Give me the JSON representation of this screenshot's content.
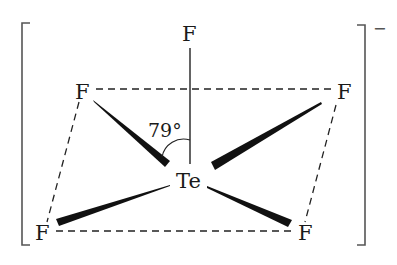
{
  "diagram": {
    "central_atom": {
      "label": "Te",
      "x": 189,
      "y": 188
    },
    "ligands": [
      {
        "id": "apical",
        "label": "F",
        "x": 190,
        "y": 41
      },
      {
        "id": "upper-left",
        "label": "F",
        "x": 82,
        "y": 99
      },
      {
        "id": "upper-right",
        "label": "F",
        "x": 344,
        "y": 99
      },
      {
        "id": "lower-left",
        "label": "F",
        "x": 42,
        "y": 239
      },
      {
        "id": "lower-right",
        "label": "F",
        "x": 305,
        "y": 239
      }
    ],
    "angle": {
      "label": "79°",
      "between": [
        "apical",
        "upper-left"
      ]
    },
    "charge": "−",
    "colors": {
      "ink": "#1a1a1a",
      "bracket": "#555555",
      "background": "#ffffff"
    }
  }
}
